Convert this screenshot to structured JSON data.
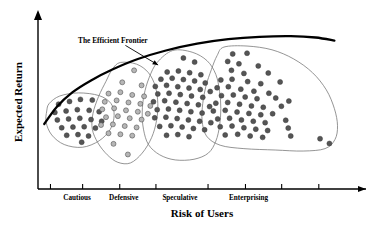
{
  "chart_data": {
    "type": "scatter",
    "title": "",
    "xlabel": "Risk of Users",
    "ylabel": "Expected Return",
    "grid": false,
    "legend_position": "none",
    "xlim": [
      0,
      100
    ],
    "ylim": [
      0,
      100
    ],
    "x_tick_labels": [
      "Cautious",
      "Defensive",
      "Speculative",
      "Enterprising"
    ],
    "x_tick_positions": [
      12.5,
      27.5,
      45.5,
      67.5
    ],
    "x_tick_mark_positions": [
      4.0,
      14.3,
      26.2,
      37.8,
      54.5,
      66.5,
      78.1,
      90.0
    ],
    "annotations": [
      {
        "text": "The Efficient Frontier",
        "x": 21.0,
        "y": 88.0,
        "arrow_from": [
          28.0,
          84.0
        ],
        "arrow_to": [
          38.5,
          72.5
        ]
      }
    ],
    "frontier_curve": {
      "name": "The Efficient Frontier",
      "color": "#000000",
      "points": [
        [
          2.0,
          38.0
        ],
        [
          6.0,
          48.0
        ],
        [
          11.0,
          56.5
        ],
        [
          17.0,
          63.5
        ],
        [
          24.0,
          70.0
        ],
        [
          32.0,
          76.0
        ],
        [
          41.0,
          81.0
        ],
        [
          51.0,
          85.0
        ],
        [
          61.0,
          87.6
        ],
        [
          71.0,
          89.0
        ],
        [
          81.0,
          89.4
        ],
        [
          89.0,
          88.6
        ],
        [
          95.0,
          86.8
        ]
      ]
    },
    "series": [
      {
        "name": "Cautious",
        "color": "#555555",
        "marker": "circle",
        "count": 22,
        "points": [
          [
            6.6,
            49.6
          ],
          [
            10.1,
            51.2
          ],
          [
            13.6,
            52.4
          ],
          [
            17.4,
            52.0
          ],
          [
            5.4,
            44.8
          ],
          [
            9.0,
            45.6
          ],
          [
            12.6,
            46.4
          ],
          [
            16.4,
            46.0
          ],
          [
            19.6,
            45.2
          ],
          [
            6.2,
            40.4
          ],
          [
            9.8,
            41.0
          ],
          [
            13.4,
            41.4
          ],
          [
            17.0,
            40.6
          ],
          [
            20.4,
            39.6
          ],
          [
            7.6,
            35.8
          ],
          [
            11.2,
            36.2
          ],
          [
            14.8,
            36.4
          ],
          [
            18.4,
            35.6
          ],
          [
            9.2,
            31.4
          ],
          [
            12.8,
            31.8
          ],
          [
            16.2,
            31.0
          ],
          [
            14.0,
            27.4
          ]
        ]
      },
      {
        "name": "Defensive",
        "color": "#b6b6b6",
        "marker": "circle",
        "count": 30,
        "points": [
          [
            30.8,
            69.4
          ],
          [
            27.0,
            62.4
          ],
          [
            33.2,
            60.6
          ],
          [
            22.6,
            55.8
          ],
          [
            26.4,
            56.6
          ],
          [
            30.2,
            55.0
          ],
          [
            34.0,
            54.2
          ],
          [
            21.4,
            51.0
          ],
          [
            25.2,
            51.8
          ],
          [
            29.0,
            50.6
          ],
          [
            32.8,
            49.8
          ],
          [
            36.0,
            48.6
          ],
          [
            20.6,
            46.6
          ],
          [
            24.4,
            47.2
          ],
          [
            28.2,
            46.0
          ],
          [
            32.0,
            45.2
          ],
          [
            35.2,
            44.0
          ],
          [
            21.8,
            42.0
          ],
          [
            25.6,
            42.6
          ],
          [
            29.4,
            41.4
          ],
          [
            33.2,
            40.6
          ],
          [
            20.2,
            37.4
          ],
          [
            24.0,
            37.8
          ],
          [
            27.8,
            36.8
          ],
          [
            31.6,
            36.0
          ],
          [
            22.6,
            32.6
          ],
          [
            26.4,
            32.0
          ],
          [
            30.2,
            31.2
          ],
          [
            24.2,
            26.4
          ],
          [
            28.8,
            20.2
          ]
        ]
      },
      {
        "name": "Speculative",
        "color": "#555555",
        "marker": "circle",
        "count": 47,
        "points": [
          [
            46.6,
            76.6
          ],
          [
            50.2,
            74.2
          ],
          [
            41.4,
            68.4
          ],
          [
            45.0,
            69.0
          ],
          [
            48.6,
            68.0
          ],
          [
            52.2,
            66.8
          ],
          [
            39.4,
            64.2
          ],
          [
            43.0,
            64.8
          ],
          [
            46.6,
            64.0
          ],
          [
            50.2,
            63.2
          ],
          [
            53.6,
            62.0
          ],
          [
            37.6,
            60.0
          ],
          [
            41.2,
            60.6
          ],
          [
            44.8,
            59.8
          ],
          [
            48.4,
            59.0
          ],
          [
            52.0,
            58.2
          ],
          [
            55.2,
            57.0
          ],
          [
            38.4,
            55.6
          ],
          [
            42.0,
            56.0
          ],
          [
            45.6,
            55.2
          ],
          [
            49.2,
            54.4
          ],
          [
            52.8,
            53.6
          ],
          [
            37.0,
            51.0
          ],
          [
            40.6,
            51.6
          ],
          [
            44.2,
            50.8
          ],
          [
            47.8,
            50.0
          ],
          [
            51.4,
            49.2
          ],
          [
            55.0,
            48.2
          ],
          [
            38.2,
            46.4
          ],
          [
            41.8,
            46.8
          ],
          [
            45.4,
            46.0
          ],
          [
            49.0,
            45.2
          ],
          [
            52.6,
            44.4
          ],
          [
            37.4,
            41.6
          ],
          [
            41.0,
            42.0
          ],
          [
            44.6,
            41.2
          ],
          [
            48.2,
            40.4
          ],
          [
            51.8,
            39.6
          ],
          [
            55.4,
            38.8
          ],
          [
            39.0,
            36.6
          ],
          [
            42.6,
            37.0
          ],
          [
            46.2,
            36.2
          ],
          [
            49.8,
            35.4
          ],
          [
            53.4,
            34.6
          ],
          [
            41.2,
            31.4
          ],
          [
            44.8,
            31.8
          ],
          [
            48.4,
            30.6
          ]
        ]
      },
      {
        "name": "Enterprising",
        "color": "#555555",
        "marker": "circle",
        "count": 55,
        "points": [
          [
            62.4,
            79.0
          ],
          [
            67.0,
            79.4
          ],
          [
            60.8,
            74.6
          ],
          [
            64.4,
            73.2
          ],
          [
            70.6,
            72.0
          ],
          [
            62.0,
            69.4
          ],
          [
            66.0,
            67.6
          ],
          [
            73.8,
            67.8
          ],
          [
            58.6,
            63.8
          ],
          [
            62.2,
            64.2
          ],
          [
            67.2,
            62.8
          ],
          [
            71.4,
            61.6
          ],
          [
            77.6,
            62.6
          ],
          [
            57.4,
            59.2
          ],
          [
            61.0,
            59.8
          ],
          [
            65.0,
            58.4
          ],
          [
            69.2,
            57.2
          ],
          [
            74.0,
            56.0
          ],
          [
            58.8,
            54.6
          ],
          [
            62.6,
            55.0
          ],
          [
            66.4,
            53.8
          ],
          [
            70.2,
            52.8
          ],
          [
            76.2,
            53.2
          ],
          [
            80.4,
            51.4
          ],
          [
            57.0,
            50.2
          ],
          [
            60.8,
            50.6
          ],
          [
            64.6,
            49.6
          ],
          [
            68.4,
            48.6
          ],
          [
            72.2,
            47.8
          ],
          [
            78.0,
            48.4
          ],
          [
            56.2,
            45.6
          ],
          [
            60.0,
            46.0
          ],
          [
            63.8,
            45.0
          ],
          [
            67.6,
            44.2
          ],
          [
            71.4,
            43.4
          ],
          [
            75.2,
            44.0
          ],
          [
            57.6,
            41.0
          ],
          [
            61.4,
            41.4
          ],
          [
            65.2,
            40.4
          ],
          [
            69.0,
            39.6
          ],
          [
            72.8,
            38.8
          ],
          [
            79.4,
            40.2
          ],
          [
            58.4,
            36.4
          ],
          [
            62.2,
            36.8
          ],
          [
            66.0,
            35.8
          ],
          [
            69.8,
            35.0
          ],
          [
            73.6,
            34.2
          ],
          [
            80.2,
            35.6
          ],
          [
            60.0,
            31.6
          ],
          [
            64.0,
            32.0
          ],
          [
            68.0,
            31.0
          ],
          [
            72.0,
            30.2
          ],
          [
            81.0,
            31.0
          ],
          [
            90.4,
            29.4
          ],
          [
            93.4,
            26.6
          ]
        ]
      }
    ],
    "hulls": [
      {
        "name": "Cautious",
        "points": [
          [
            3.6,
            50.0
          ],
          [
            7.0,
            54.4
          ],
          [
            13.0,
            56.2
          ],
          [
            19.6,
            54.6
          ],
          [
            23.4,
            50.0
          ],
          [
            24.4,
            43.0
          ],
          [
            23.2,
            35.0
          ],
          [
            19.6,
            28.2
          ],
          [
            14.2,
            24.4
          ],
          [
            8.4,
            26.0
          ],
          [
            4.4,
            31.6
          ],
          [
            2.6,
            39.0
          ],
          [
            2.8,
            45.6
          ]
        ]
      },
      {
        "name": "Defensive",
        "points": [
          [
            26.4,
            74.0
          ],
          [
            31.6,
            73.0
          ],
          [
            35.4,
            68.0
          ],
          [
            37.6,
            60.0
          ],
          [
            38.4,
            50.0
          ],
          [
            38.0,
            40.0
          ],
          [
            36.4,
            30.0
          ],
          [
            33.4,
            21.0
          ],
          [
            29.6,
            15.2
          ],
          [
            25.6,
            15.6
          ],
          [
            22.2,
            20.0
          ],
          [
            19.2,
            27.0
          ],
          [
            17.4,
            35.0
          ],
          [
            17.6,
            44.0
          ],
          [
            19.4,
            54.0
          ],
          [
            21.8,
            63.0
          ],
          [
            23.8,
            70.0
          ]
        ]
      },
      {
        "name": "Speculative",
        "points": [
          [
            43.2,
            81.0
          ],
          [
            49.4,
            80.0
          ],
          [
            54.2,
            75.0
          ],
          [
            57.0,
            67.0
          ],
          [
            58.2,
            57.0
          ],
          [
            58.6,
            47.0
          ],
          [
            58.2,
            37.0
          ],
          [
            57.0,
            28.0
          ],
          [
            54.6,
            21.0
          ],
          [
            50.0,
            17.4
          ],
          [
            44.0,
            17.0
          ],
          [
            39.0,
            20.0
          ],
          [
            35.4,
            26.0
          ],
          [
            33.8,
            35.0
          ],
          [
            33.4,
            45.0
          ],
          [
            34.0,
            55.0
          ],
          [
            35.6,
            65.0
          ],
          [
            38.2,
            74.0
          ]
        ]
      },
      {
        "name": "Enterprising",
        "points": [
          [
            59.6,
            83.0
          ],
          [
            67.0,
            83.6
          ],
          [
            75.0,
            81.4
          ],
          [
            82.0,
            76.0
          ],
          [
            88.0,
            68.0
          ],
          [
            92.4,
            58.0
          ],
          [
            95.0,
            47.0
          ],
          [
            96.0,
            37.0
          ],
          [
            95.2,
            29.0
          ],
          [
            92.0,
            23.6
          ],
          [
            85.0,
            22.2
          ],
          [
            76.0,
            22.8
          ],
          [
            66.0,
            23.6
          ],
          [
            58.4,
            25.6
          ],
          [
            54.0,
            31.0
          ],
          [
            52.6,
            40.0
          ],
          [
            52.8,
            50.0
          ],
          [
            53.8,
            60.0
          ],
          [
            55.6,
            70.0
          ],
          [
            57.4,
            78.0
          ]
        ]
      }
    ]
  },
  "axes": {
    "y_arrow": "arrow-up",
    "x_arrow": "arrow-right"
  }
}
